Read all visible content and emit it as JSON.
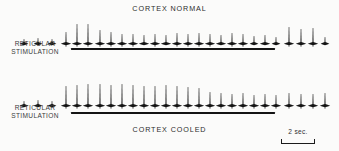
{
  "figure": {
    "background_color": "#fbfbfa",
    "ink_color": "#141414"
  },
  "panels": [
    {
      "id": "normal",
      "title": "CORTEX NORMAL",
      "stimulation_label_line1": "RETICULAR",
      "stimulation_label_line2": "STIMULATION"
    },
    {
      "id": "cooled",
      "title": "CORTEX COOLED",
      "stimulation_label_line1": "RETICULAR",
      "stimulation_label_line2": "STIMULATION"
    }
  ],
  "scale": {
    "label": "2 sec.",
    "value": 2,
    "unit": "sec",
    "bar_length_px": 34
  },
  "chart_data": {
    "type": "line",
    "subtitle": "",
    "xlabel": "time",
    "ylabel": "unit discharge",
    "grid": false,
    "legend_position": "none",
    "xlim": [
      0,
      339
    ],
    "ylim": [
      0,
      34
    ],
    "annotations": [
      {
        "text": "CORTEX NORMAL",
        "x": 170,
        "y": 8
      },
      {
        "text": "CORTEX COOLED",
        "x": 170,
        "y": 67
      },
      {
        "text": "RETICULAR STIMULATION",
        "x": 35,
        "y": 44
      },
      {
        "text": "RETICULAR STIMULATION",
        "x": 35,
        "y": 108
      },
      {
        "text": "2 sec.",
        "x": 297,
        "y": 131
      }
    ],
    "stimulation_bars": [
      {
        "panel": "normal",
        "x_start": 71,
        "x_end": 275,
        "y": 48
      },
      {
        "panel": "cooled",
        "x_start": 71,
        "x_end": 275,
        "y": 112
      }
    ],
    "series": [
      {
        "name": "CORTEX NORMAL",
        "baseline_y": 30,
        "spikes": [
          {
            "x": 24,
            "height": 5
          },
          {
            "x": 38,
            "height": 6
          },
          {
            "x": 52,
            "height": 5
          },
          {
            "x": 66,
            "height": 12
          },
          {
            "x": 77,
            "height": 20
          },
          {
            "x": 88,
            "height": 20
          },
          {
            "x": 100,
            "height": 14
          },
          {
            "x": 111,
            "height": 12
          },
          {
            "x": 122,
            "height": 10
          },
          {
            "x": 133,
            "height": 10
          },
          {
            "x": 144,
            "height": 9
          },
          {
            "x": 155,
            "height": 10
          },
          {
            "x": 166,
            "height": 9
          },
          {
            "x": 177,
            "height": 11
          },
          {
            "x": 188,
            "height": 10
          },
          {
            "x": 199,
            "height": 11
          },
          {
            "x": 210,
            "height": 10
          },
          {
            "x": 221,
            "height": 9
          },
          {
            "x": 232,
            "height": 11
          },
          {
            "x": 243,
            "height": 10
          },
          {
            "x": 254,
            "height": 8
          },
          {
            "x": 265,
            "height": 9
          },
          {
            "x": 276,
            "height": 7
          },
          {
            "x": 289,
            "height": 17
          },
          {
            "x": 301,
            "height": 15
          },
          {
            "x": 313,
            "height": 16
          },
          {
            "x": 325,
            "height": 7
          }
        ]
      },
      {
        "name": "CORTEX COOLED",
        "baseline_y": 30,
        "spikes": [
          {
            "x": 24,
            "height": 5
          },
          {
            "x": 38,
            "height": 6
          },
          {
            "x": 52,
            "height": 5
          },
          {
            "x": 66,
            "height": 20
          },
          {
            "x": 77,
            "height": 21
          },
          {
            "x": 88,
            "height": 22
          },
          {
            "x": 100,
            "height": 22
          },
          {
            "x": 111,
            "height": 21
          },
          {
            "x": 122,
            "height": 22
          },
          {
            "x": 133,
            "height": 21
          },
          {
            "x": 144,
            "height": 20
          },
          {
            "x": 155,
            "height": 20
          },
          {
            "x": 166,
            "height": 21
          },
          {
            "x": 177,
            "height": 20
          },
          {
            "x": 188,
            "height": 19
          },
          {
            "x": 199,
            "height": 18
          },
          {
            "x": 210,
            "height": 14
          },
          {
            "x": 221,
            "height": 13
          },
          {
            "x": 232,
            "height": 12
          },
          {
            "x": 243,
            "height": 13
          },
          {
            "x": 254,
            "height": 11
          },
          {
            "x": 265,
            "height": 12
          },
          {
            "x": 276,
            "height": 11
          },
          {
            "x": 289,
            "height": 13
          },
          {
            "x": 301,
            "height": 12
          },
          {
            "x": 313,
            "height": 12
          },
          {
            "x": 325,
            "height": 13
          }
        ]
      }
    ]
  }
}
